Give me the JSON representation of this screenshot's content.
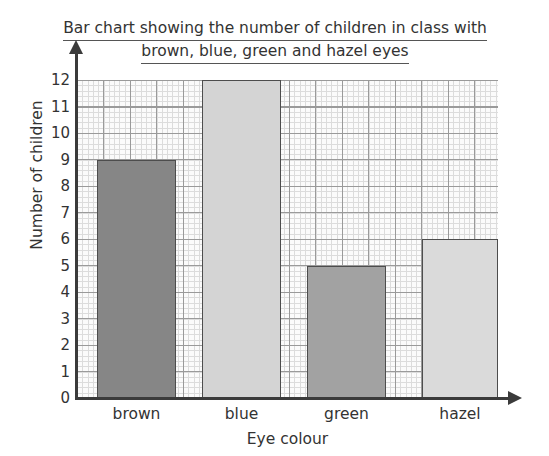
{
  "chart_data": {
    "type": "bar",
    "title": "Bar chart showing the number of children in class with brown, blue, green and hazel eyes",
    "title_line1": "Bar chart showing the number of children in class with",
    "title_line2": "brown, blue, green and hazel eyes",
    "xlabel": "Eye colour",
    "ylabel": "Number of children",
    "categories": [
      "brown",
      "blue",
      "green",
      "hazel"
    ],
    "values": [
      9,
      12,
      5,
      6
    ],
    "ylim": [
      0,
      12
    ],
    "ytick_labels": [
      "0",
      "1",
      "2",
      "3",
      "4",
      "5",
      "6",
      "7",
      "8",
      "9",
      "10",
      "11",
      "12"
    ],
    "grid": true,
    "legend": "none",
    "bar_colors": [
      "#868686",
      "#d4d4d4",
      "#a2a2a2",
      "#dadada"
    ],
    "bar_edge_color": "#4d4d4d",
    "axis_color": "#3b3b3b",
    "grid_major_color": "#9a9a9a",
    "grid_minor_color": "#dcdcdc",
    "plot_background": "#fbfbfb",
    "bars": [
      {
        "category": "brown",
        "value": 9,
        "color": "#868686",
        "left_px": 20,
        "width_px": 79
      },
      {
        "category": "blue",
        "value": 12,
        "color": "#d4d4d4",
        "left_px": 125,
        "width_px": 79
      },
      {
        "category": "green",
        "value": 5,
        "color": "#a2a2a2",
        "left_px": 230,
        "width_px": 79
      },
      {
        "category": "hazel",
        "value": 6,
        "color": "#dadada",
        "left_px": 345,
        "width_px": 76
      }
    ]
  }
}
